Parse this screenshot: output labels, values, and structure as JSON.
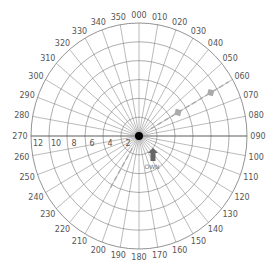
{
  "diagram": {
    "type": "radar-maneuvering-board",
    "center": {
      "x": 139,
      "y": 136
    },
    "radius_x": 108,
    "radius_y": 113,
    "colors": {
      "grid": "#777777",
      "text": "#555555",
      "vector": "#aaaaaa",
      "own_ship": "#666666",
      "center": "#000000"
    },
    "range_rings": [
      2,
      4,
      6,
      8,
      10,
      12
    ],
    "range_labels": [
      "12",
      "10",
      "8",
      "6",
      "4",
      "2"
    ],
    "bearing_step": 10,
    "bearing_labels": [
      "000",
      "010",
      "020",
      "030",
      "040",
      "050",
      "060",
      "070",
      "080",
      "090",
      "100",
      "110",
      "120",
      "130",
      "140",
      "150",
      "160",
      "170",
      "180",
      "190",
      "200",
      "210",
      "220",
      "230",
      "240",
      "250",
      "260",
      "270",
      "280",
      "290",
      "300",
      "310",
      "320",
      "330",
      "340",
      "350"
    ],
    "own_ship": {
      "label": "OWN",
      "heading": 0,
      "x": 153,
      "y": 155
    },
    "vectors": [
      {
        "name": "relative-motion-line-ne",
        "from_bearing": 60,
        "from_range": 1.5,
        "to_bearing": 60,
        "to_range": 11.5,
        "markers": [
          5,
          9.2
        ]
      },
      {
        "name": "relative-motion-line-sw",
        "from_bearing": 210,
        "from_range": 1.5,
        "to_bearing": 210,
        "to_range": 6.5,
        "markers": []
      }
    ]
  }
}
